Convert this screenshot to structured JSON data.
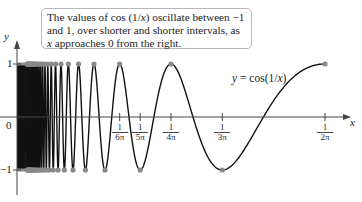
{
  "callout": {
    "text": "The values of cos (1/x) oscillate between −1 and 1, over shorter and shorter intervals, as x approaches 0 from the right."
  },
  "curve_label": "y = cos(1/x)",
  "axes": {
    "x_label": "x",
    "y_label": "y",
    "origin_label": "0",
    "y_tick_top": "1",
    "y_tick_bottom": "−1"
  },
  "ticks": [
    {
      "num": "1",
      "den": "6π",
      "value": 0.05305
    },
    {
      "num": "1",
      "den": "5π",
      "value": 0.06366
    },
    {
      "num": "1",
      "den": "4π",
      "value": 0.07958
    },
    {
      "num": "1",
      "den": "3π",
      "value": 0.1061
    },
    {
      "num": "1",
      "den": "2π",
      "value": 0.15915
    }
  ],
  "colors": {
    "curve": "#111111",
    "dot": "#8a8a8a",
    "axis": "#444444",
    "callout_border": "#b9b9b9"
  },
  "chart_data": {
    "type": "line",
    "title": "",
    "function": "y = cos(1/x)",
    "xlabel": "x",
    "ylabel": "y",
    "xlim": [
      0,
      0.17
    ],
    "ylim": [
      -1,
      1
    ],
    "x_ticks": [
      "1/6π",
      "1/5π",
      "1/4π",
      "1/3π",
      "1/2π"
    ],
    "y_ticks": [
      "1",
      "−1"
    ],
    "annotation": "The values of cos (1/x) oscillate between −1 and 1, over shorter and shorter intervals, as x approaches 0 from the right.",
    "marked_points": "extrema at x = 1/(nπ): y = 1 for even n, y = −1 for odd n"
  }
}
